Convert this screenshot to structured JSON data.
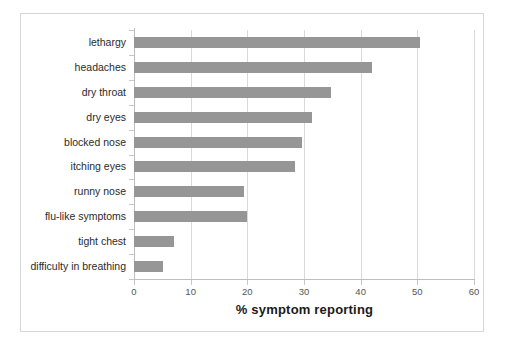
{
  "chart_data": {
    "type": "bar",
    "orientation": "horizontal",
    "title": "",
    "xlabel": "% symptom reporting",
    "ylabel": "",
    "xlim": [
      0,
      60
    ],
    "xticks": [
      0,
      10,
      20,
      30,
      40,
      50,
      60
    ],
    "grid": true,
    "legend": false,
    "bar_color": "#969696",
    "categories": [
      "lethargy",
      "headaches",
      "dry throat",
      "dry eyes",
      "blocked nose",
      "itching eyes",
      "runny nose",
      "flu-like symptoms",
      "tight chest",
      "difficulty in breathing"
    ],
    "values": [
      50.4,
      42.0,
      34.7,
      31.4,
      29.7,
      28.4,
      19.4,
      20.0,
      7.0,
      5.2
    ]
  },
  "axis": {
    "x_title": "% symptom reporting"
  }
}
